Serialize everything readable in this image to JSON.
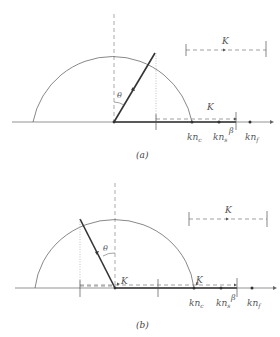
{
  "figure": {
    "panels": [
      {
        "id": "a",
        "caption": "(a)",
        "angle_label": "θ",
        "vector_label_top": "K",
        "vector_label_axis": "K",
        "axis_points": [
          {
            "label_base": "kn",
            "label_sub": "c"
          },
          {
            "label_base": "kn",
            "label_sub": "s"
          },
          {
            "label_base": "kn",
            "label_sub": "f"
          }
        ],
        "beta_label": "β"
      },
      {
        "id": "b",
        "caption": "(b)",
        "angle_label": "θ",
        "vector_label_top": "K",
        "vector_label_origin": "K",
        "vector_label_axis": "K",
        "axis_points": [
          {
            "label_base": "kn",
            "label_sub": "c"
          },
          {
            "label_base": "kn",
            "label_sub": "s"
          },
          {
            "label_base": "kn",
            "label_sub": "f"
          }
        ],
        "beta_label": "β"
      }
    ],
    "colors": {
      "line": "#555555",
      "thick": "#333333",
      "dashed": "#777777"
    }
  }
}
